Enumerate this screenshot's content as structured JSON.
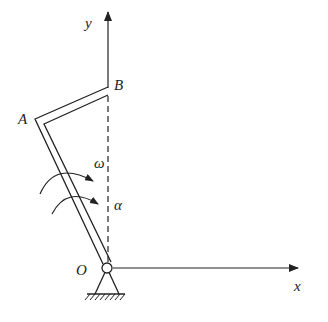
{
  "diagram": {
    "type": "mechanism",
    "labels": {
      "y_axis": "y",
      "x_axis": "x",
      "point_a": "A",
      "point_b": "B",
      "origin": "O",
      "angular_velocity": "ω",
      "angular_acceleration": "α"
    },
    "colors": {
      "stroke": "#222222",
      "background": "#ffffff"
    }
  }
}
